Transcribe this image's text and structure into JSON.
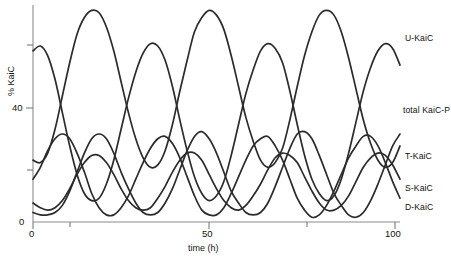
{
  "axes": {
    "ylabel": "% KaiC",
    "xlabel": "time (h)",
    "ytick_0": "0",
    "ytick_40": "40",
    "xtick_0": "0",
    "xtick_50": "50",
    "xtick_100": "100"
  },
  "legend": {
    "u_kaic": "U-KaiC",
    "total_kaic_p": "total KaiC-P",
    "t_kaic": "T-KaiC",
    "s_kaic": "S-KaiC",
    "d_kaic": "D-KaiC"
  },
  "chart_data": {
    "type": "line",
    "title": "",
    "xlabel": "time (h)",
    "ylabel": "% KaiC",
    "xlim": [
      0,
      100
    ],
    "ylim": [
      0,
      90
    ],
    "xticks": [
      0,
      50,
      100
    ],
    "xticks_minor": [
      25,
      75
    ],
    "yticks": [
      0,
      40
    ],
    "yticks_minor": [
      20,
      60
    ],
    "grid": false,
    "legend_position": "right",
    "line_color": "#2b2b2b",
    "period_hours": 24,
    "x": [
      0,
      2,
      4,
      6,
      8,
      10,
      12,
      14,
      16,
      18,
      20,
      22,
      24,
      26,
      28,
      30,
      32,
      34,
      36,
      38,
      40,
      42,
      44,
      46,
      48,
      50,
      52,
      54,
      56,
      58,
      60,
      62,
      64,
      66,
      68,
      70,
      72,
      74,
      76,
      78,
      80,
      82,
      84,
      86,
      88,
      90,
      92,
      94,
      96,
      98,
      100
    ],
    "series": [
      {
        "name": "U-KaiC",
        "values": [
          72,
          74,
          70,
          60,
          46,
          32,
          20,
          12,
          9,
          10,
          16,
          26,
          39,
          52,
          63,
          71,
          75,
          74,
          68,
          57,
          43,
          30,
          19,
          12,
          9,
          11,
          17,
          28,
          41,
          54,
          64,
          72,
          75,
          73,
          67,
          55,
          41,
          28,
          18,
          12,
          9,
          11,
          18,
          29,
          42,
          55,
          65,
          72,
          75,
          73,
          66
        ]
      },
      {
        "name": "total KaiC-P",
        "values": [
          26,
          25,
          29,
          39,
          53,
          67,
          79,
          86,
          89,
          88,
          82,
          72,
          59,
          46,
          35,
          27,
          23,
          24,
          30,
          41,
          55,
          68,
          80,
          86,
          89,
          87,
          81,
          70,
          57,
          44,
          34,
          26,
          23,
          25,
          31,
          43,
          57,
          70,
          80,
          87,
          89,
          87,
          80,
          69,
          56,
          43,
          33,
          26,
          23,
          25,
          32
        ]
      },
      {
        "name": "T-KaiC",
        "values": [
          18,
          23,
          30,
          35,
          37,
          35,
          29,
          21,
          12,
          6,
          3,
          3,
          6,
          11,
          18,
          25,
          31,
          35,
          36,
          33,
          27,
          19,
          11,
          5,
          3,
          3,
          6,
          12,
          19,
          26,
          32,
          35,
          36,
          32,
          26,
          18,
          10,
          5,
          2,
          3,
          7,
          13,
          20,
          27,
          32,
          36,
          36,
          32,
          25,
          17,
          10
        ]
      },
      {
        "name": "S-KaiC",
        "values": [
          8,
          6,
          5,
          6,
          9,
          14,
          20,
          25,
          28,
          28,
          25,
          20,
          14,
          9,
          6,
          5,
          6,
          10,
          15,
          21,
          26,
          29,
          29,
          26,
          20,
          14,
          9,
          6,
          5,
          7,
          11,
          16,
          22,
          27,
          29,
          28,
          25,
          19,
          13,
          8,
          5,
          5,
          7,
          11,
          17,
          23,
          27,
          29,
          28,
          24,
          18
        ]
      },
      {
        "name": "D-KaiC",
        "values": [
          4,
          3,
          3,
          4,
          7,
          13,
          21,
          29,
          35,
          37,
          35,
          29,
          21,
          14,
          8,
          4,
          3,
          4,
          8,
          14,
          22,
          30,
          36,
          38,
          35,
          29,
          21,
          13,
          8,
          4,
          3,
          4,
          8,
          15,
          23,
          31,
          37,
          38,
          35,
          28,
          20,
          12,
          7,
          3,
          2,
          4,
          9,
          16,
          24,
          32,
          37
        ]
      }
    ]
  }
}
